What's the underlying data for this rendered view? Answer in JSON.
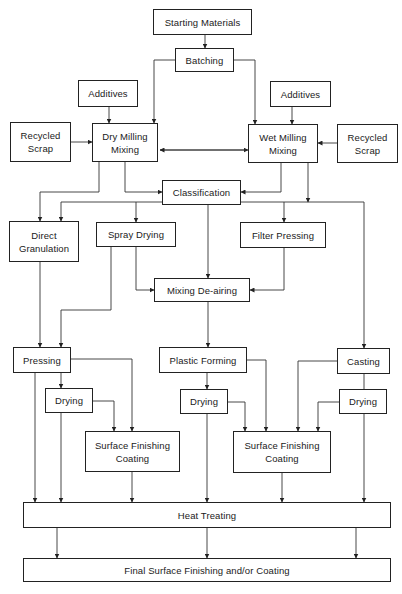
{
  "diagram": {
    "type": "flowchart",
    "nodes": {
      "starting_materials": "Starting Materials",
      "batching": "Batching",
      "additives_left": "Additives",
      "additives_right": "Additives",
      "recycled_scrap_left": "Recycled\nScrap",
      "recycled_scrap_right": "Recycled\nScrap",
      "dry_milling": "Dry Milling\nMixing",
      "wet_milling": "Wet Milling\nMixing",
      "classification": "Classification",
      "direct_granulation": "Direct\nGranulation",
      "spray_drying": "Spray Drying",
      "filter_pressing": "Filter Pressing",
      "mixing_deairing": "Mixing De-airing",
      "pressing": "Pressing",
      "plastic_forming": "Plastic Forming",
      "casting": "Casting",
      "drying_left": "Drying",
      "drying_middle": "Drying",
      "drying_right": "Drying",
      "surface_finishing_left": "Surface Finishing\nCoating",
      "surface_finishing_right": "Surface Finishing\nCoating",
      "heat_treating": "Heat Treating",
      "final_finishing": "Final Surface Finishing and/or Coating"
    },
    "edges": [
      [
        "starting_materials",
        "batching"
      ],
      [
        "batching",
        "dry_milling"
      ],
      [
        "batching",
        "wet_milling"
      ],
      [
        "additives_left",
        "dry_milling"
      ],
      [
        "additives_right",
        "wet_milling"
      ],
      [
        "recycled_scrap_left",
        "dry_milling"
      ],
      [
        "recycled_scrap_right",
        "wet_milling"
      ],
      [
        "dry_milling",
        "wet_milling",
        "bidirectional"
      ],
      [
        "dry_milling",
        "classification"
      ],
      [
        "wet_milling",
        "classification"
      ],
      [
        "dry_milling",
        "direct_granulation"
      ],
      [
        "classification",
        "direct_granulation"
      ],
      [
        "classification",
        "spray_drying"
      ],
      [
        "classification",
        "filter_pressing"
      ],
      [
        "wet_milling",
        "filter_pressing"
      ],
      [
        "classification",
        "casting"
      ],
      [
        "classification",
        "mixing_deairing"
      ],
      [
        "spray_drying",
        "mixing_deairing"
      ],
      [
        "filter_pressing",
        "mixing_deairing"
      ],
      [
        "direct_granulation",
        "pressing"
      ],
      [
        "spray_drying",
        "pressing"
      ],
      [
        "mixing_deairing",
        "plastic_forming"
      ],
      [
        "pressing",
        "drying_left"
      ],
      [
        "pressing",
        "surface_finishing_left"
      ],
      [
        "drying_left",
        "surface_finishing_left"
      ],
      [
        "plastic_forming",
        "drying_middle"
      ],
      [
        "plastic_forming",
        "surface_finishing_right"
      ],
      [
        "drying_middle",
        "surface_finishing_right"
      ],
      [
        "casting",
        "surface_finishing_right"
      ],
      [
        "casting",
        "drying_right"
      ],
      [
        "drying_right",
        "surface_finishing_right"
      ],
      [
        "pressing",
        "heat_treating"
      ],
      [
        "drying_left",
        "heat_treating"
      ],
      [
        "surface_finishing_left",
        "heat_treating"
      ],
      [
        "drying_middle",
        "heat_treating"
      ],
      [
        "surface_finishing_right",
        "heat_treating"
      ],
      [
        "drying_right",
        "heat_treating"
      ],
      [
        "heat_treating",
        "final_finishing"
      ]
    ]
  }
}
